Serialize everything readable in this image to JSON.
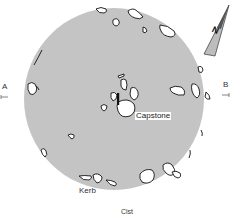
{
  "diagram": {
    "type": "archaeological site plan (cairn)",
    "mound_fill": "#c4c4c4",
    "labels": {
      "capstone": "Capstone",
      "kerb": "Kerb",
      "cist": "Cist",
      "section_a": "A",
      "section_b": "B",
      "north": "N"
    }
  }
}
